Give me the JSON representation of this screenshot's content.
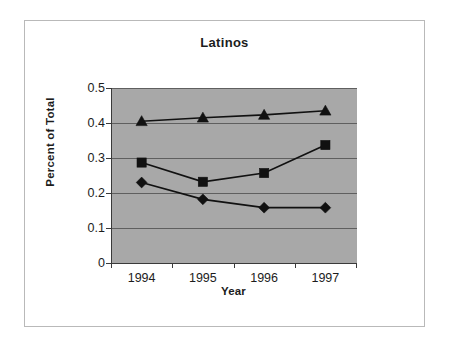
{
  "chart_data": {
    "type": "line",
    "title": "Latinos",
    "xlabel": "Year",
    "ylabel": "Percent of Total",
    "categories": [
      "1994",
      "1995",
      "1996",
      "1997"
    ],
    "x": [
      1994,
      1995,
      1996,
      1997
    ],
    "ylim": [
      0,
      0.5
    ],
    "ytick_labels": [
      "0",
      "0.1",
      "0.2",
      "0.3",
      "0.4",
      "0.5"
    ],
    "ytick_values": [
      0,
      0.1,
      0.2,
      0.3,
      0.4,
      0.5
    ],
    "grid": true,
    "legend": "none",
    "plot_background": "#a8a8a8",
    "series": [
      {
        "name": "series-triangle",
        "marker": "triangle",
        "color": "#111111",
        "values": [
          0.405,
          0.415,
          0.423,
          0.435
        ]
      },
      {
        "name": "series-square",
        "marker": "square",
        "color": "#111111",
        "values": [
          0.287,
          0.232,
          0.257,
          0.337
        ]
      },
      {
        "name": "series-diamond",
        "marker": "diamond",
        "color": "#111111",
        "values": [
          0.23,
          0.182,
          0.158,
          0.158
        ]
      }
    ]
  }
}
